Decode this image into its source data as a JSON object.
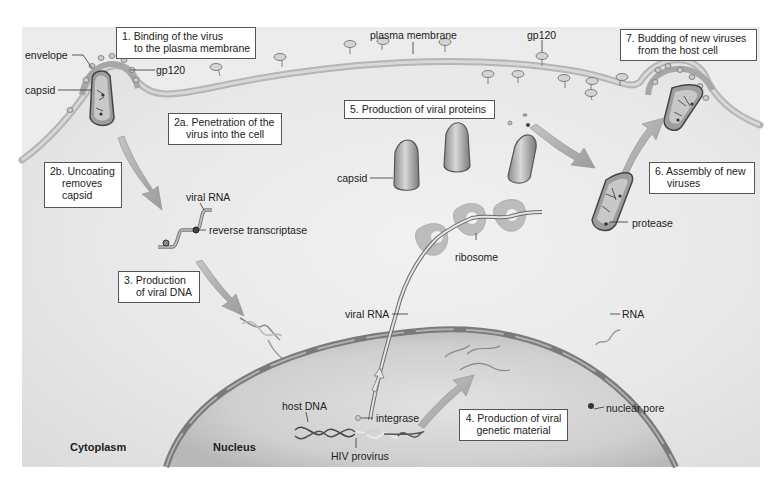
{
  "diagram": {
    "regions": {
      "cytoplasm": "Cytoplasm",
      "nucleus": "Nucleus"
    },
    "steps": [
      {
        "id": "1",
        "line1": "1. Binding of the virus",
        "line2": "to the plasma membrane"
      },
      {
        "id": "2a",
        "line1": "2a. Penetration of the",
        "line2": "virus into the cell"
      },
      {
        "id": "2b",
        "line1": "2b. Uncoating",
        "line2": "removes",
        "line3": "capsid"
      },
      {
        "id": "3",
        "line1": "3. Production",
        "line2": "of viral DNA"
      },
      {
        "id": "4",
        "line1": "4. Production of viral",
        "line2": "genetic material"
      },
      {
        "id": "5",
        "line1": "5. Production of viral proteins"
      },
      {
        "id": "6",
        "line1": "6. Assembly of new",
        "line2": "viruses"
      },
      {
        "id": "7",
        "line1": "7. Budding of new viruses",
        "line2": "from the host cell"
      }
    ],
    "labels": {
      "envelope": "envelope",
      "gp120_left": "gp120",
      "capsid_left": "capsid",
      "plasma_membrane": "plasma membrane",
      "gp120_top": "gp120",
      "viral_rna_cyto": "viral RNA",
      "reverse_transcriptase": "reverse transcriptase",
      "capsid_mid": "capsid",
      "ribosome": "ribosome",
      "protease": "protease",
      "viral_rna_nucleus": "viral RNA",
      "rna": "RNA",
      "host_dna": "host DNA",
      "integrase": "integrase",
      "hiv_provirus": "HIV provirus",
      "nuclear_pore": "nuclear pore"
    },
    "colors": {
      "cytoplasm_bg": "#e6e6e6",
      "membrane": "#b9b9b9",
      "nucleus_fill": "#cfcfcf",
      "nuclear_envelope": "#7d7d7d",
      "label_box_border": "#555555",
      "arrow": "#a8a8a8"
    }
  }
}
